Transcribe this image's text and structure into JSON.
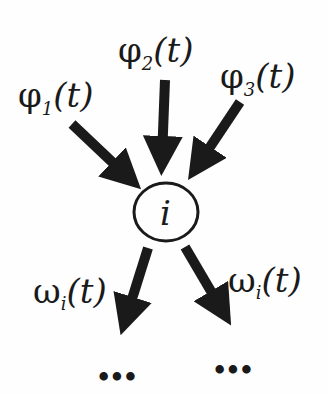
{
  "diagram": {
    "node": {
      "label": "i"
    },
    "inputs": [
      {
        "symbol": "φ",
        "subscript": "1",
        "arg": "(t)"
      },
      {
        "symbol": "φ",
        "subscript": "2",
        "arg": "(t)"
      },
      {
        "symbol": "φ",
        "subscript": "3",
        "arg": "(t)"
      }
    ],
    "outputs": [
      {
        "symbol": "ω",
        "subscript": "i",
        "arg": "(t)"
      },
      {
        "symbol": "ω",
        "subscript": "i",
        "arg": "(t)"
      }
    ],
    "continuation": [
      "•••",
      "•••"
    ],
    "colors": {
      "ink": "#1a1a1a",
      "background": "#ffffff"
    }
  }
}
